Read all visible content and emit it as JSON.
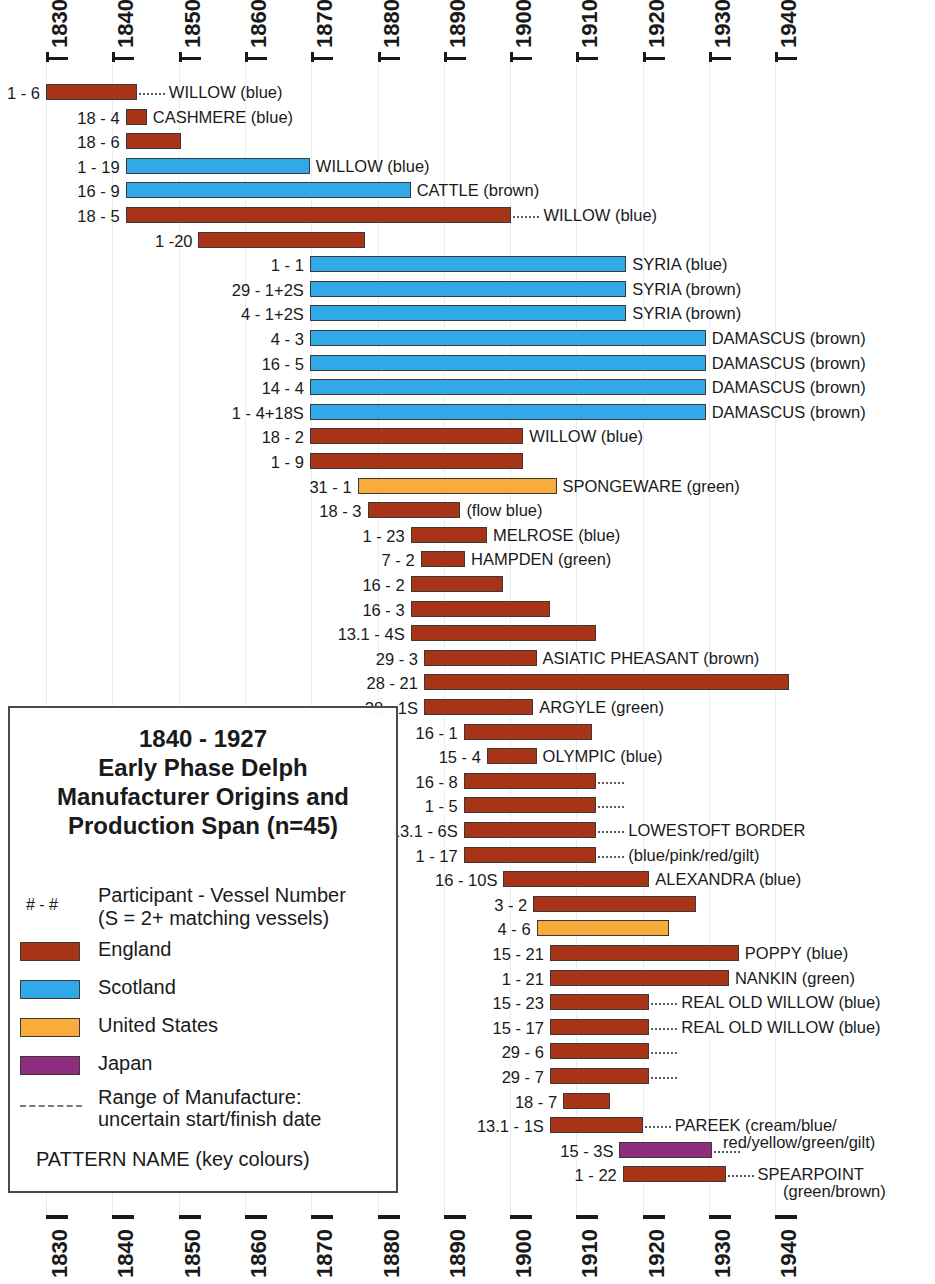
{
  "chart_data": {
    "type": "bar",
    "title": "1840 - 1927 Early Phase Delph Manufacturer Origins and Production Span (n=45)",
    "xlabel": "",
    "ylabel": "",
    "xlim": [
      1826,
      1946
    ],
    "grid": true,
    "orientation": "horizontal-range",
    "axis_ticks": [
      "1830",
      "1840",
      "1850",
      "1860",
      "1870",
      "1880",
      "1890",
      "1900",
      "1910",
      "1920",
      "1930",
      "1940"
    ],
    "legend_position": "lower-left-inset",
    "series": [
      {
        "name": "England",
        "color": "#a83418"
      },
      {
        "name": "Scotland",
        "color": "#31a8e8"
      },
      {
        "name": "United States",
        "color": "#f9ab3c"
      },
      {
        "name": "Japan",
        "color": "#8e2d7e"
      }
    ],
    "bars": [
      {
        "label": "1 - 6",
        "origin": "England",
        "start": 1830.0,
        "end": 1843.7,
        "dots_end": true,
        "dots_start": false,
        "pattern": "WILLOW (blue)"
      },
      {
        "label": "18 - 4",
        "origin": "England",
        "start": 1842.0,
        "end": 1845.2,
        "dots_end": false,
        "dots_start": false,
        "pattern": "CASHMERE (blue)"
      },
      {
        "label": "18 - 6",
        "origin": "England",
        "start": 1842.0,
        "end": 1850.4,
        "dots_end": false,
        "dots_start": false,
        "pattern": ""
      },
      {
        "label": "1 - 19",
        "origin": "Scotland",
        "start": 1842.0,
        "end": 1869.8,
        "dots_end": false,
        "dots_start": false,
        "pattern": "WILLOW (blue)"
      },
      {
        "label": "16 - 9",
        "origin": "Scotland",
        "start": 1842.0,
        "end": 1885.0,
        "dots_end": false,
        "dots_start": false,
        "pattern": "CATTLE (brown)"
      },
      {
        "label": "18 - 5",
        "origin": "England",
        "start": 1842.0,
        "end": 1900.2,
        "dots_end": true,
        "dots_start": false,
        "pattern": "WILLOW (blue)"
      },
      {
        "label": "1 -20",
        "origin": "England",
        "start": 1853.0,
        "end": 1878.1,
        "dots_end": false,
        "dots_start": false,
        "pattern": ""
      },
      {
        "label": "1 - 1",
        "origin": "Scotland",
        "start": 1869.8,
        "end": 1917.5,
        "dots_end": false,
        "dots_start": false,
        "pattern": "SYRIA (blue)"
      },
      {
        "label": "29 - 1+2S",
        "origin": "Scotland",
        "start": 1869.8,
        "end": 1917.5,
        "dots_end": false,
        "dots_start": false,
        "pattern": "SYRIA (brown)"
      },
      {
        "label": "4 - 1+2S",
        "origin": "Scotland",
        "start": 1869.8,
        "end": 1917.5,
        "dots_end": false,
        "dots_start": false,
        "pattern": "SYRIA (brown)"
      },
      {
        "label": "4 - 3",
        "origin": "Scotland",
        "start": 1869.8,
        "end": 1929.5,
        "dots_end": false,
        "dots_start": false,
        "pattern": "DAMASCUS (brown)"
      },
      {
        "label": "16 - 5",
        "origin": "Scotland",
        "start": 1869.8,
        "end": 1929.5,
        "dots_end": false,
        "dots_start": false,
        "pattern": "DAMASCUS (brown)"
      },
      {
        "label": "14 - 4",
        "origin": "Scotland",
        "start": 1869.8,
        "end": 1929.5,
        "dots_end": false,
        "dots_start": false,
        "pattern": "DAMASCUS (brown)"
      },
      {
        "label": "1 - 4+18S",
        "origin": "Scotland",
        "start": 1869.8,
        "end": 1929.5,
        "dots_end": false,
        "dots_start": false,
        "pattern": "DAMASCUS (brown)"
      },
      {
        "label": "18 - 2",
        "origin": "England",
        "start": 1869.8,
        "end": 1902.0,
        "dots_end": false,
        "dots_start": false,
        "pattern": "WILLOW (blue)"
      },
      {
        "label": "1 - 9",
        "origin": "England",
        "start": 1869.8,
        "end": 1902.0,
        "dots_end": false,
        "dots_start": false,
        "pattern": ""
      },
      {
        "label": "31 - 1",
        "origin": "United States",
        "start": 1877.0,
        "end": 1907.0,
        "dots_end": false,
        "dots_start": false,
        "pattern": "SPONGEWARE (green)"
      },
      {
        "label": "18 - 3",
        "origin": "England",
        "start": 1878.5,
        "end": 1892.5,
        "dots_end": false,
        "dots_start": false,
        "pattern": "(flow blue)"
      },
      {
        "label": "1 - 23",
        "origin": "England",
        "start": 1885.0,
        "end": 1896.5,
        "dots_end": false,
        "dots_start": false,
        "pattern": "MELROSE (blue)"
      },
      {
        "label": "7 - 2",
        "origin": "England",
        "start": 1886.5,
        "end": 1893.2,
        "dots_end": false,
        "dots_start": false,
        "pattern": "HAMPDEN (green)"
      },
      {
        "label": "16 - 2",
        "origin": "England",
        "start": 1885.0,
        "end": 1899.0,
        "dots_end": false,
        "dots_start": false,
        "pattern": ""
      },
      {
        "label": "16 - 3",
        "origin": "England",
        "start": 1885.0,
        "end": 1906.0,
        "dots_end": false,
        "dots_start": false,
        "pattern": ""
      },
      {
        "label": "13.1 - 4S",
        "origin": "England",
        "start": 1885.0,
        "end": 1913.0,
        "dots_end": false,
        "dots_start": false,
        "pattern": ""
      },
      {
        "label": "29 - 3",
        "origin": "England",
        "start": 1887.0,
        "end": 1904.0,
        "dots_end": false,
        "dots_start": false,
        "pattern": "ASIATIC PHEASANT (brown)"
      },
      {
        "label": "28 - 21",
        "origin": "England",
        "start": 1887.0,
        "end": 1942.0,
        "dots_end": false,
        "dots_start": false,
        "pattern": ""
      },
      {
        "label": "28 - 1S",
        "origin": "England",
        "start": 1887.0,
        "end": 1903.5,
        "dots_end": false,
        "dots_start": false,
        "pattern": "ARGYLE (green)"
      },
      {
        "label": "16 - 1",
        "origin": "England",
        "start": 1893.0,
        "end": 1912.4,
        "dots_end": false,
        "dots_start": false,
        "pattern": ""
      },
      {
        "label": "15 - 4",
        "origin": "England",
        "start": 1896.5,
        "end": 1904.0,
        "dots_end": false,
        "dots_start": false,
        "pattern": "OLYMPIC (blue)"
      },
      {
        "label": "16 - 8",
        "origin": "England",
        "start": 1893.0,
        "end": 1913.0,
        "dots_end": true,
        "dots_start": false,
        "pattern": ""
      },
      {
        "label": "1 - 5",
        "origin": "England",
        "start": 1893.0,
        "end": 1913.0,
        "dots_end": true,
        "dots_start": false,
        "pattern": ""
      },
      {
        "label": "13.1 - 6S",
        "origin": "England",
        "start": 1893.0,
        "end": 1913.0,
        "dots_end": true,
        "dots_start": false,
        "pattern": "LOWESTOFT BORDER"
      },
      {
        "label": "1 - 17",
        "origin": "England",
        "start": 1893.0,
        "end": 1913.0,
        "dots_end": true,
        "dots_start": false,
        "pattern": "(blue/pink/red/gilt)"
      },
      {
        "label": "16 - 10S",
        "origin": "England",
        "start": 1899.0,
        "end": 1921.0,
        "dots_end": false,
        "dots_start": false,
        "pattern": "ALEXANDRA (blue)"
      },
      {
        "label": "3 - 2",
        "origin": "England",
        "start": 1903.5,
        "end": 1928.0,
        "dots_end": false,
        "dots_start": false,
        "pattern": ""
      },
      {
        "label": "4 - 6",
        "origin": "United States",
        "start": 1904.0,
        "end": 1924.0,
        "dots_end": false,
        "dots_start": false,
        "pattern": ""
      },
      {
        "label": "15 - 21",
        "origin": "England",
        "start": 1906.0,
        "end": 1934.5,
        "dots_end": false,
        "dots_start": false,
        "pattern": "POPPY (blue)"
      },
      {
        "label": "1 - 21",
        "origin": "England",
        "start": 1906.0,
        "end": 1933.0,
        "dots_end": false,
        "dots_start": false,
        "pattern": "NANKIN (green)"
      },
      {
        "label": "15 - 23",
        "origin": "England",
        "start": 1906.0,
        "end": 1921.0,
        "dots_end": true,
        "dots_start": false,
        "pattern": "REAL OLD WILLOW (blue)"
      },
      {
        "label": "15 - 17",
        "origin": "England",
        "start": 1906.0,
        "end": 1921.0,
        "dots_end": true,
        "dots_start": false,
        "pattern": "REAL OLD WILLOW (blue)"
      },
      {
        "label": "29 - 6",
        "origin": "England",
        "start": 1906.0,
        "end": 1921.0,
        "dots_end": true,
        "dots_start": false,
        "pattern": ""
      },
      {
        "label": "29 - 7",
        "origin": "England",
        "start": 1906.0,
        "end": 1921.0,
        "dots_end": true,
        "dots_start": false,
        "pattern": ""
      },
      {
        "label": "18 - 7",
        "origin": "England",
        "start": 1908.0,
        "end": 1915.0,
        "dots_end": false,
        "dots_start": false,
        "pattern": ""
      },
      {
        "label": "13.1 - 1S",
        "origin": "England",
        "start": 1906.0,
        "end": 1920.0,
        "dots_end": true,
        "dots_start": false,
        "pattern": "PAREEK (cream/blue/"
      },
      {
        "label": "15 - 3S",
        "origin": "Japan",
        "start": 1916.5,
        "end": 1930.5,
        "dots_end": true,
        "dots_start": false,
        "pattern": ""
      },
      {
        "label": "1 - 22",
        "origin": "England",
        "start": 1917.0,
        "end": 1932.5,
        "dots_end": true,
        "dots_start": false,
        "pattern": "SPEARPOINT"
      }
    ],
    "annotations": [
      {
        "text": "(blue/pink/red/gilt)",
        "attached_to": "13.1 - 6S / 1 - 17"
      },
      {
        "text": "red/yellow/green/gilt)",
        "attached_to": "13.1 - 1S"
      },
      {
        "text": "(green/brown)",
        "attached_to": "1 - 22"
      }
    ]
  },
  "axis": {
    "top_labels": [
      "1830",
      "1840",
      "1850",
      "1860",
      "1870",
      "1880",
      "1890",
      "1900",
      "1910",
      "1920",
      "1930",
      "1940"
    ],
    "bottom_labels": [
      "1830",
      "1840",
      "1850",
      "1860",
      "1870",
      "1880",
      "1890",
      "1900",
      "1910",
      "1920",
      "1930",
      "1940"
    ]
  },
  "legend": {
    "title_lines": [
      "1840 - 1927",
      "Early Phase Delph",
      "Manufacturer Origins and",
      "Production Span (n=45)"
    ],
    "hash_symbol": "# - #",
    "participant_line1": "Participant - Vessel Number",
    "participant_line2": "(S = 2+ matching vessels)",
    "items": [
      {
        "label": "England",
        "color": "#a83418"
      },
      {
        "label": "Scotland",
        "color": "#31a8e8"
      },
      {
        "label": "United States",
        "color": "#f9ab3c"
      },
      {
        "label": "Japan",
        "color": "#8e2d7e"
      }
    ],
    "range_line1": "Range of Manufacture:",
    "range_line2": "uncertain start/finish date",
    "pattern_note": "PATTERN NAME (key colours)"
  },
  "pattern_extra": {
    "lowestoft_sub": "(blue/pink/red/gilt)",
    "pareek_sub": "red/yellow/green/gilt)",
    "spearpoint_sub": "(green/brown)"
  }
}
